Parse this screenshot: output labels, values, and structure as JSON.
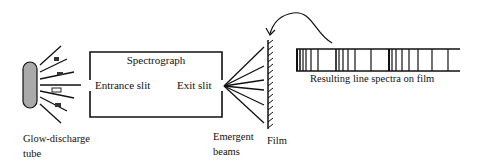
{
  "diagram": {
    "type": "process-schematic",
    "labels": {
      "spectrograph": "Spectrograph",
      "entrance_slit": "Entrance slit",
      "exit_slit": "Exit slit",
      "tube_line1": "Glow-discharge",
      "tube_line2": "tube",
      "beams_line1": "Emergent",
      "beams_line2": "beams",
      "film": "Film",
      "spectra": "Resulting line spectra on film"
    },
    "components": [
      {
        "id": "glow-discharge-tube",
        "label": "Glow-discharge tube",
        "fill": "#aaaaaa"
      },
      {
        "id": "spectrograph",
        "label": "Spectrograph"
      },
      {
        "id": "entrance-slit",
        "label": "Entrance slit"
      },
      {
        "id": "exit-slit",
        "label": "Exit slit"
      },
      {
        "id": "emergent-beams",
        "label": "Emergent beams"
      },
      {
        "id": "film",
        "label": "Film"
      },
      {
        "id": "line-spectra",
        "label": "Resulting line spectra on film"
      }
    ],
    "connections": [
      {
        "from": "glow-discharge-tube",
        "to": "entrance-slit",
        "kind": "light rays"
      },
      {
        "from": "exit-slit",
        "to": "film",
        "kind": "emergent beams"
      },
      {
        "from": "line-spectra",
        "to": "film",
        "kind": "curved arrow"
      }
    ],
    "spectrum_lines_x": [
      298,
      300,
      302,
      304,
      307,
      312,
      318,
      336,
      338,
      340,
      344,
      349,
      355,
      371,
      390,
      392,
      394,
      398,
      404,
      410,
      419,
      432,
      447
    ],
    "colors": {
      "ink": "#111111",
      "tube_fill": "#aaaaaa",
      "background": "#ffffff"
    }
  }
}
